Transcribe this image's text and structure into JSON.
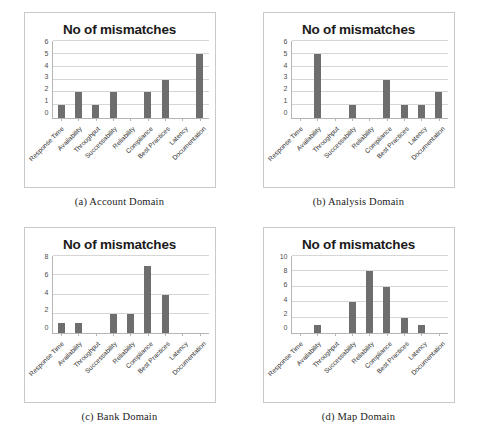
{
  "figure": {
    "panel_border_color": "#c9c9c9",
    "bar_color": "#6e6e6e",
    "gridline_color": "#d6d6d6",
    "axis_color": "#b5b5b5"
  },
  "categories": [
    "Response Time",
    "Availability",
    "Throughput",
    "Successability",
    "Reliability",
    "Compliance",
    "Best Practices",
    "Latency",
    "Documentation"
  ],
  "panels": [
    {
      "key": "a",
      "caption": "(a) Account Domain",
      "chart_data": {
        "type": "bar",
        "title": "No of mismatches",
        "xlabel": "",
        "ylabel": "",
        "ylim": [
          0,
          6
        ],
        "yticks": [
          0,
          1,
          2,
          3,
          4,
          5,
          6
        ],
        "grid": true,
        "legend": "none",
        "categories": [
          "Response Time",
          "Availability",
          "Throughput",
          "Successability",
          "Reliability",
          "Compliance",
          "Best Practices",
          "Latency",
          "Documentation"
        ],
        "values": [
          1,
          2,
          1,
          2,
          0,
          2,
          3,
          0,
          5
        ]
      }
    },
    {
      "key": "b",
      "caption": "(b) Analysis Domain",
      "chart_data": {
        "type": "bar",
        "title": "No of mismatches",
        "xlabel": "",
        "ylabel": "",
        "ylim": [
          0,
          6
        ],
        "yticks": [
          0,
          1,
          2,
          3,
          4,
          5,
          6
        ],
        "grid": true,
        "legend": "none",
        "categories": [
          "Response Time",
          "Availability",
          "Throughput",
          "Successability",
          "Reliability",
          "Compliance",
          "Best Practices",
          "Latency",
          "Documentation"
        ],
        "values": [
          0,
          5,
          0,
          1,
          0,
          3,
          1,
          1,
          2
        ]
      }
    },
    {
      "key": "c",
      "caption": "(c) Bank Domain",
      "chart_data": {
        "type": "bar",
        "title": "No of mismatches",
        "xlabel": "",
        "ylabel": "",
        "ylim": [
          0,
          8
        ],
        "yticks": [
          0,
          2,
          4,
          6,
          8
        ],
        "grid": true,
        "legend": "none",
        "categories": [
          "Response Time",
          "Availability",
          "Throughput",
          "Successability",
          "Reliability",
          "Compliance",
          "Best Practices",
          "Latency",
          "Documentation"
        ],
        "values": [
          1,
          1,
          0,
          2,
          2,
          7,
          4,
          0,
          0
        ]
      }
    },
    {
      "key": "d",
      "caption": "(d) Map Domain",
      "chart_data": {
        "type": "bar",
        "title": "No of mismatches",
        "xlabel": "",
        "ylabel": "",
        "ylim": [
          0,
          10
        ],
        "yticks": [
          0,
          2,
          4,
          6,
          8,
          10
        ],
        "grid": true,
        "legend": "none",
        "categories": [
          "Response Time",
          "Availability",
          "Throughput",
          "Successability",
          "Reliability",
          "Compliance",
          "Best Practices",
          "Latency",
          "Documentation"
        ],
        "values": [
          0,
          1,
          0,
          4,
          8,
          6,
          2,
          1,
          0
        ]
      }
    }
  ]
}
